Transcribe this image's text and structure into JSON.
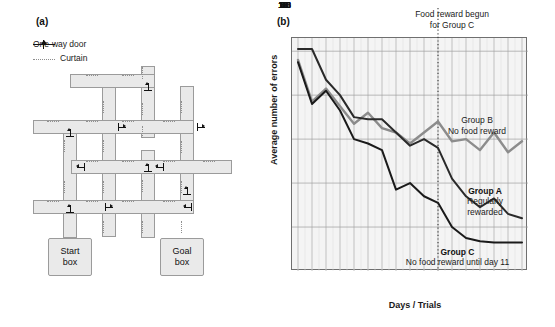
{
  "panels": {
    "a": {
      "label": "(a)"
    },
    "b": {
      "label": "(b)"
    }
  },
  "maze": {
    "legend": [
      {
        "icon": "one-way-door-icon",
        "label": "One-way door"
      },
      {
        "icon": "curtain-icon",
        "label": "Curtain"
      }
    ],
    "start_box": "Start\nbox",
    "start_box_line1": "Start",
    "start_box_line2": "box",
    "goal_box_line1": "Goal",
    "goal_box_line2": "box",
    "colors": {
      "corridor_fill": "#e9e9e9",
      "corridor_stroke": "#9b9b9b",
      "curtain": "#909090",
      "door": "#111111"
    }
  },
  "chart_data": {
    "type": "line",
    "title": "",
    "xlabel": "Days / Trials",
    "ylabel": "Average number of errors",
    "x": [
      1,
      2,
      3,
      4,
      5,
      6,
      7,
      8,
      9,
      10,
      11,
      12,
      13,
      14,
      15,
      16,
      17
    ],
    "xlim": [
      1,
      17
    ],
    "ylim": [
      0,
      10.6
    ],
    "yticks": [
      0,
      2,
      4,
      6,
      8,
      10
    ],
    "xticks": [
      1,
      2,
      3,
      4,
      5,
      6,
      7,
      8,
      9,
      10,
      11,
      12,
      13,
      14,
      15,
      16,
      17
    ],
    "grid": true,
    "legend_position": "inline-annotations",
    "series": [
      {
        "name": "Group A",
        "description": "Regularly rewarded",
        "color": "#2a2a2a",
        "values": [
          10.1,
          10.1,
          8.7,
          8.0,
          7.0,
          6.9,
          6.9,
          6.3,
          5.7,
          6.0,
          5.6,
          4.2,
          3.4,
          2.9,
          3.3,
          2.6,
          2.4
        ]
      },
      {
        "name": "Group B",
        "description": "No food reward",
        "color": "#8c8c8c",
        "values": [
          9.6,
          7.7,
          8.3,
          7.5,
          6.7,
          7.2,
          6.5,
          6.3,
          5.8,
          6.3,
          6.8,
          5.9,
          6.0,
          5.5,
          6.3,
          5.4,
          5.9
        ]
      },
      {
        "name": "Group C",
        "description": "No food reward until day 11",
        "color": "#1a1a1a",
        "values": [
          9.5,
          7.6,
          8.2,
          7.3,
          6.0,
          5.8,
          5.5,
          3.7,
          4.0,
          3.4,
          3.1,
          2.0,
          1.5,
          1.35,
          1.3,
          1.3,
          1.3
        ]
      }
    ],
    "annotations": [
      {
        "name": "food-reward-marker",
        "text_line1": "Food reward begun",
        "text_line2": "for Group C",
        "x": 11,
        "style": "dotted-vertical"
      },
      {
        "name": "group-b-label",
        "text_line1": "Group B",
        "text_line2": "No food reward"
      },
      {
        "name": "group-a-label",
        "text_line1": "Group A",
        "text_line2": "Regularly",
        "text_line3": "rewarded"
      },
      {
        "name": "group-c-label",
        "text_line1": "Group C",
        "text_line2": "No food reward until day 11"
      }
    ]
  }
}
